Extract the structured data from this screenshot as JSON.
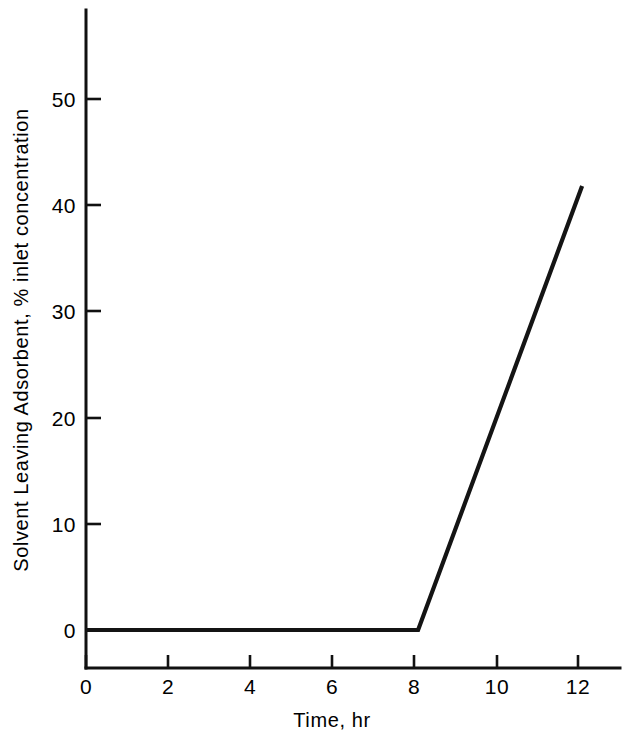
{
  "chart_data": {
    "type": "line",
    "title": "",
    "xlabel": "Time, hr",
    "ylabel": "Solvent Leaving Adsorbent, % inlet concentration",
    "xlim": [
      0,
      13
    ],
    "ylim": [
      0,
      55
    ],
    "xticks": [
      0,
      2,
      4,
      6,
      8,
      10,
      12
    ],
    "xtick_labels": [
      "0",
      "2",
      "4",
      "6",
      "8",
      "10",
      "12"
    ],
    "yticks": [
      0,
      10,
      20,
      30,
      40,
      50
    ],
    "ytick_labels": [
      "0",
      "10",
      "20",
      "30",
      "40",
      "50"
    ],
    "grid": false,
    "legend": null,
    "series": [
      {
        "name": "Breakthrough curve",
        "color": "#141414",
        "x": [
          0.0,
          8.1,
          12.1
        ],
        "y": [
          0.0,
          0.0,
          41.8
        ]
      }
    ],
    "annotations": []
  },
  "axes": {
    "y_axis_name": "y-axis",
    "x_axis_name": "x-axis"
  }
}
